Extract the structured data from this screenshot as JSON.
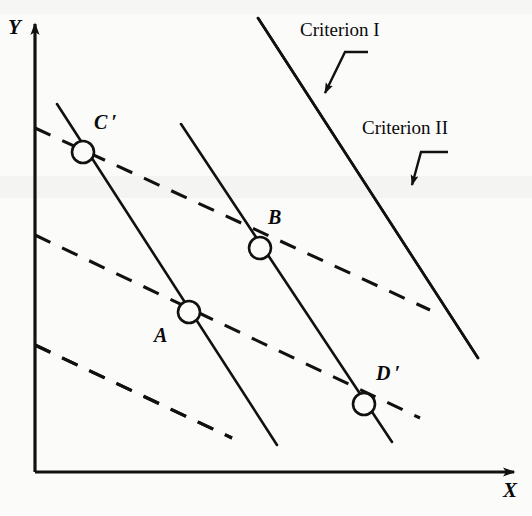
{
  "figure": {
    "type": "line-diagram",
    "width": 532,
    "height": 516,
    "background_color": "#fbfbfa",
    "ink_color": "#111111"
  },
  "axes": {
    "x_label": "X",
    "y_label": "Y",
    "x_axis": {
      "x1": 35,
      "y1": 472,
      "x2": 522,
      "y2": 472,
      "arrow": "right"
    },
    "y_axis": {
      "x1": 35,
      "y1": 472,
      "x2": 35,
      "y2": 18,
      "arrow": "up"
    },
    "x_label_pos": {
      "x": 503,
      "y": 485
    },
    "y_label_pos": {
      "x": 8,
      "y": 18
    }
  },
  "annotations": [
    {
      "id": "criterion-1",
      "label": "Criterion I",
      "label_pos": {
        "x": 300,
        "y": 22
      },
      "leader": {
        "x1": 345,
        "y1": 52,
        "x2": 368,
        "y2": 52,
        "x3": 318,
        "y3": 98
      },
      "target": "solid-line-family"
    },
    {
      "id": "criterion-2",
      "label": "Criterion II",
      "label_pos": {
        "x": 362,
        "y": 120
      },
      "leader": {
        "x1": 420,
        "y1": 152,
        "x2": 448,
        "y2": 152,
        "x3": 408,
        "y3": 190
      },
      "target": "dashed-line-family"
    }
  ],
  "points": [
    {
      "id": "C-prime",
      "label": "C ′",
      "cx": 83,
      "cy": 152,
      "r": 11,
      "label_pos": {
        "x": 96,
        "y": 114
      }
    },
    {
      "id": "B",
      "label": "B",
      "cx": 260,
      "cy": 248,
      "r": 11,
      "label_pos": {
        "x": 268,
        "y": 209
      }
    },
    {
      "id": "A",
      "label": "A",
      "cx": 189,
      "cy": 312,
      "r": 11,
      "label_pos": {
        "x": 154,
        "y": 327
      }
    },
    {
      "id": "D-prime",
      "label": "D ′",
      "cx": 364,
      "cy": 404,
      "r": 11,
      "label_pos": {
        "x": 376,
        "y": 365
      }
    }
  ],
  "chart_data": {
    "type": "line",
    "title": "",
    "xlabel": "X",
    "ylabel": "Y",
    "solid_lines": [
      {
        "id": "solid-1",
        "x1": 46,
        "y1": 275,
        "x2": 158,
        "y2": 445,
        "style": "solid",
        "family": "Criterion I"
      },
      {
        "id": "solid-2",
        "x1": 57,
        "y1": 104,
        "x2": 277,
        "y2": 445,
        "style": "solid",
        "family": "Criterion I",
        "through": [
          "C-prime",
          "A"
        ]
      },
      {
        "id": "solid-3",
        "x1": 181,
        "y1": 124,
        "x2": 392,
        "y2": 442,
        "style": "solid",
        "family": "Criterion I",
        "through": [
          "B",
          "D-prime"
        ]
      },
      {
        "id": "solid-4",
        "x1": 258,
        "y1": 18,
        "x2": 478,
        "y2": 358,
        "style": "solid",
        "family": "Criterion I"
      }
    ],
    "dashed_lines": [
      {
        "id": "dashed-1",
        "x1": 96,
        "y1": 31,
        "x2": 487,
        "y2": 202,
        "style": "dashed",
        "family": "Criterion II"
      },
      {
        "id": "dashed-2",
        "x1": 35,
        "y1": 128,
        "x2": 430,
        "y2": 310,
        "style": "dashed",
        "family": "Criterion II",
        "through": [
          "C-prime",
          "B"
        ]
      },
      {
        "id": "dashed-3",
        "x1": 35,
        "y1": 235,
        "x2": 420,
        "y2": 418,
        "style": "dashed",
        "family": "Criterion II",
        "through": [
          "A",
          "D-prime"
        ]
      },
      {
        "id": "dashed-4",
        "x1": 35,
        "y1": 345,
        "x2": 232,
        "y2": 438,
        "style": "dashed",
        "family": "Criterion II"
      }
    ],
    "legend": [
      "Criterion I",
      "Criterion II"
    ],
    "grid": false
  }
}
